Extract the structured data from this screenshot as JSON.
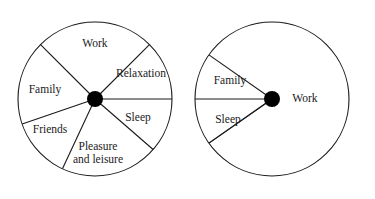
{
  "figure": {
    "background_color": "#ffffff",
    "line_color": "#1a1a1a",
    "hub_color": "#000000",
    "text_color": "#1a1a1a"
  },
  "chart_data": {
    "type": "pie",
    "xlabel": "",
    "ylabel": "",
    "charts": [
      {
        "name": "balanced-wheel",
        "center_x": 95,
        "center_y": 99,
        "radius": 77,
        "hub_radius": 8,
        "categories": [
          "Work",
          "Relaxation",
          "Sleep",
          "Pleasure and leisure",
          "Friends",
          "Family"
        ],
        "start_angles_deg": [
          45,
          0,
          -41,
          -115,
          -161,
          135
        ],
        "end_angles_deg": [
          135,
          45,
          0,
          -41,
          -115,
          -161
        ],
        "values": [
          90,
          45,
          41,
          74,
          46,
          64
        ],
        "labels": [
          {
            "text": "Work",
            "x": 95,
            "y": 44
          },
          {
            "text": "Relaxation",
            "x": 141,
            "y": 74
          },
          {
            "text": "Sleep",
            "x": 138,
            "y": 118
          },
          {
            "text": "Pleasure",
            "x": 98,
            "y": 147
          },
          {
            "text": "and leisure",
            "x": 98,
            "y": 160
          },
          {
            "text": "Friends",
            "x": 50,
            "y": 130
          },
          {
            "text": "Family",
            "x": 45,
            "y": 90
          }
        ]
      },
      {
        "name": "unbalanced-wheel",
        "center_x": 272,
        "center_y": 99,
        "radius": 77,
        "hub_radius": 8,
        "categories": [
          "Work",
          "Family",
          "Sleep"
        ],
        "start_angles_deg": [
          -145,
          145,
          180
        ],
        "end_angles_deg": [
          145,
          180,
          215
        ],
        "values": [
          290,
          35,
          35
        ],
        "labels": [
          {
            "text": "Work",
            "x": 305,
            "y": 99
          },
          {
            "text": "Family",
            "x": 230,
            "y": 81
          },
          {
            "text": "Sleep",
            "x": 228,
            "y": 120
          }
        ]
      }
    ],
    "axis": {
      "grid": false,
      "legend": false
    }
  },
  "left_wheel": {
    "name": "balanced-life-wheel",
    "slices": [
      {
        "id": "work",
        "label": "Work"
      },
      {
        "id": "relaxation",
        "label": "Relaxation"
      },
      {
        "id": "sleep",
        "label": "Sleep"
      },
      {
        "id": "pleasure",
        "label_line1": "Pleasure",
        "label_line2": "and leisure"
      },
      {
        "id": "friends",
        "label": "Friends"
      },
      {
        "id": "family",
        "label": "Family"
      }
    ]
  },
  "right_wheel": {
    "name": "unbalanced-life-wheel",
    "slices": [
      {
        "id": "work",
        "label": "Work"
      },
      {
        "id": "family",
        "label": "Family"
      },
      {
        "id": "sleep",
        "label": "Sleep"
      }
    ]
  }
}
